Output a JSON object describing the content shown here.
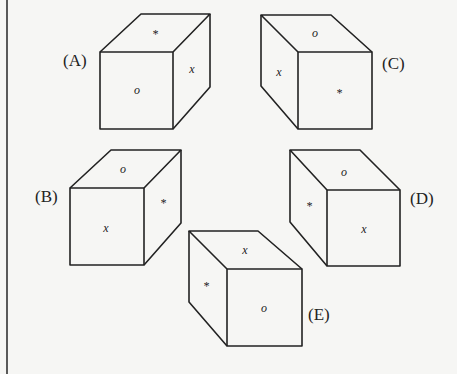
{
  "figure": {
    "border_color": "#333333",
    "line_color": "#222222",
    "background": "#f6f6f4"
  },
  "cubes": [
    {
      "label": "(A)",
      "orientation": "right-side-visible",
      "faces": {
        "top": "*",
        "front": "o",
        "side": "x"
      }
    },
    {
      "label": "(B)",
      "orientation": "right-side-visible",
      "faces": {
        "top": "o",
        "front": "x",
        "side": "*"
      }
    },
    {
      "label": "(C)",
      "orientation": "left-side-visible",
      "faces": {
        "top": "o",
        "front": "*",
        "side": "x"
      }
    },
    {
      "label": "(D)",
      "orientation": "left-side-visible",
      "faces": {
        "top": "o",
        "front": "x",
        "side": "*"
      }
    },
    {
      "label": "(E)",
      "orientation": "left-side-visible",
      "faces": {
        "top": "x",
        "front": "o",
        "side": "*"
      }
    }
  ]
}
